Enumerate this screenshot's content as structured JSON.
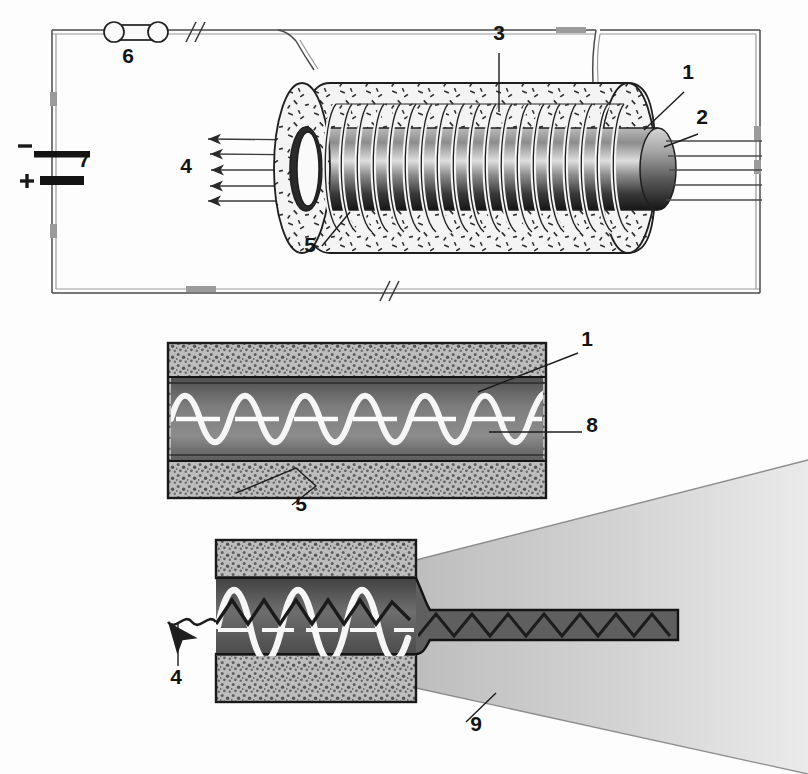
{
  "figure": {
    "background_color": "#fdfdfd",
    "ink_color": "#1c1c1c"
  },
  "callouts": [
    {
      "id": "c1",
      "label": "1",
      "x": 688,
      "y": 79,
      "meaning": "core"
    },
    {
      "id": "c2",
      "label": "2",
      "x": 702,
      "y": 124,
      "meaning": "core-end-face"
    },
    {
      "id": "c3",
      "label": "3",
      "x": 499,
      "y": 40,
      "meaning": "solenoid-winding"
    },
    {
      "id": "c4",
      "label": "4",
      "x": 186,
      "y": 173,
      "meaning": "emitted-light-beams"
    },
    {
      "id": "c5",
      "label": "5",
      "x": 310,
      "y": 252,
      "meaning": "cladding"
    },
    {
      "id": "c6",
      "label": "6",
      "x": 128,
      "y": 63,
      "meaning": "switch-lamp"
    },
    {
      "id": "c7",
      "label": "7",
      "x": 84,
      "y": 167,
      "meaning": "battery"
    },
    {
      "id": "c1b",
      "label": "1",
      "x": 587,
      "y": 346,
      "meaning": "core"
    },
    {
      "id": "c8",
      "label": "8",
      "x": 592,
      "y": 432,
      "meaning": "fiber-axis"
    },
    {
      "id": "c5b",
      "label": "5",
      "x": 301,
      "y": 511,
      "meaning": "cladding"
    },
    {
      "id": "c4b",
      "label": "4",
      "x": 176,
      "y": 684,
      "meaning": "emitted-light"
    },
    {
      "id": "c9",
      "label": "9",
      "x": 476,
      "y": 731,
      "meaning": "expanding-beam-cone"
    }
  ],
  "circuit": {
    "battery": {
      "negative_symbol": "−",
      "positive_symbol": "+",
      "label": "7"
    },
    "component": {
      "label": "6",
      "type": "lamp-switch"
    },
    "break_marks": 3
  },
  "top_view": {
    "coil_turns": 19,
    "beam_arrow_count": 5,
    "exit_ray_count": 5
  },
  "middle_view": {
    "wave_cycles": 4,
    "dash_count": 6,
    "cladding_color": "#bdbdbd",
    "core_color": "#6f6f6f",
    "wave_color": "#ffffff"
  },
  "bottom_view": {
    "wave_cycles": 3,
    "zigzag_bounces": 9,
    "narrow_guide_bounces": 10,
    "cone_color": "#c9c9c9"
  }
}
